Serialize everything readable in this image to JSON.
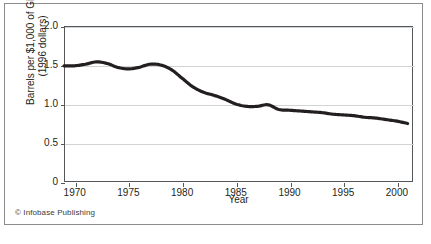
{
  "figure": {
    "credit": "© Infobase Publishing",
    "source_note": ""
  },
  "chart_data": {
    "type": "line",
    "title": "",
    "xlabel": "Year",
    "ylabel": "Barrels per $1,000 of GDP (1996 dollars)",
    "ylabel_line1": "Barrels per $1,000 of GDP",
    "ylabel_line2": "(1996 dollars)",
    "xlim": [
      1969,
      2001.5
    ],
    "ylim": [
      0,
      2.0
    ],
    "grid": "horizontal",
    "legend": "none",
    "line_color": "#231f20",
    "xticks": [
      1970,
      1975,
      1980,
      1985,
      1990,
      1995,
      2000
    ],
    "xtick_labels": [
      "1970",
      "1975",
      "1980",
      "1985",
      "1990",
      "1995",
      "2000"
    ],
    "yticks": [
      0,
      0.5,
      1.0,
      1.5,
      2.0
    ],
    "ytick_labels": [
      "0",
      "0.5",
      "1.0",
      "1.5",
      "2.0"
    ],
    "series": [
      {
        "name": "Energy intensity",
        "x": [
          1969,
          1970,
          1971,
          1972,
          1973,
          1974,
          1975,
          1976,
          1977,
          1978,
          1979,
          1980,
          1981,
          1982,
          1983,
          1984,
          1985,
          1986,
          1987,
          1988,
          1989,
          1990,
          1991,
          1992,
          1993,
          1994,
          1995,
          1996,
          1997,
          1998,
          1999,
          2000,
          2001
        ],
        "values": [
          1.49,
          1.49,
          1.51,
          1.54,
          1.52,
          1.47,
          1.45,
          1.47,
          1.51,
          1.5,
          1.44,
          1.33,
          1.22,
          1.15,
          1.11,
          1.06,
          1.0,
          0.97,
          0.97,
          0.99,
          0.93,
          0.92,
          0.91,
          0.9,
          0.89,
          0.87,
          0.86,
          0.85,
          0.83,
          0.82,
          0.8,
          0.78,
          0.75
        ]
      }
    ]
  }
}
